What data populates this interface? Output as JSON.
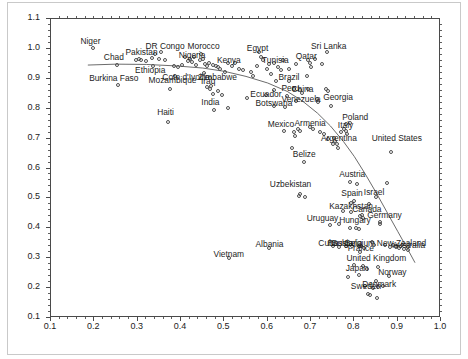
{
  "chart_data": {
    "type": "scatter",
    "title": "",
    "subtitle": "",
    "xlabel": "",
    "ylabel": "",
    "xlim": [
      0.1,
      1.0
    ],
    "ylim": [
      0.1,
      1.1
    ],
    "xticks": [
      "0.1",
      "0.2",
      "0.3",
      "0.4",
      "0.5",
      "0.6",
      "0.7",
      "0.8",
      "0.9",
      "1.0"
    ],
    "xtick_values": [
      0.1,
      0.2,
      0.3,
      0.4,
      0.5,
      0.6,
      0.7,
      0.8,
      0.9,
      1.0
    ],
    "yticks": [
      "0.1",
      "0.2",
      "0.3",
      "0.4",
      "0.5",
      "0.6",
      "0.7",
      "0.8",
      "0.9",
      "1.0",
      "1.1"
    ],
    "ytick_values": [
      0.1,
      0.2,
      0.3,
      0.4,
      0.5,
      0.6,
      0.7,
      0.8,
      0.9,
      1.0,
      1.1
    ],
    "grid": false,
    "legend": "none",
    "marker": "open-circle",
    "marker_color": "#4f4f4f",
    "trend_line": {
      "label": "fitted-trend-curve",
      "color": "#5a5a5a",
      "points": [
        [
          0.185,
          0.946
        ],
        [
          0.25,
          0.949
        ],
        [
          0.32,
          0.948
        ],
        [
          0.39,
          0.943
        ],
        [
          0.45,
          0.936
        ],
        [
          0.5,
          0.925
        ],
        [
          0.55,
          0.908
        ],
        [
          0.6,
          0.886
        ],
        [
          0.645,
          0.858
        ],
        [
          0.68,
          0.826
        ],
        [
          0.715,
          0.785
        ],
        [
          0.745,
          0.742
        ],
        [
          0.775,
          0.69
        ],
        [
          0.8,
          0.64
        ],
        [
          0.825,
          0.582
        ],
        [
          0.85,
          0.52
        ],
        [
          0.875,
          0.455
        ],
        [
          0.9,
          0.39
        ],
        [
          0.925,
          0.325
        ],
        [
          0.94,
          0.285
        ]
      ]
    },
    "labeled_points": [
      {
        "name": "Niger",
        "x": 0.2,
        "y": 0.999,
        "lx": 0.168,
        "ly": 1.022
      },
      {
        "name": "Chad",
        "x": 0.254,
        "y": 0.944,
        "lx": 0.222,
        "ly": 0.968
      },
      {
        "name": "Burkina Faso",
        "x": 0.256,
        "y": 0.876,
        "lx": 0.188,
        "ly": 0.9
      },
      {
        "name": "Pakistan",
        "x": 0.305,
        "y": 0.962,
        "lx": 0.272,
        "ly": 0.985
      },
      {
        "name": "Ethiopia",
        "x": 0.338,
        "y": 0.94,
        "lx": 0.294,
        "ly": 0.926
      },
      {
        "name": "DR Congo",
        "x": 0.355,
        "y": 0.985,
        "lx": 0.318,
        "ly": 1.005
      },
      {
        "name": "Mozambique",
        "x": 0.377,
        "y": 0.862,
        "lx": 0.325,
        "ly": 0.892
      },
      {
        "name": "Cote d'Ivoire",
        "x": 0.388,
        "y": 0.906,
        "lx": 0.357,
        "ly": 0.903
      },
      {
        "name": "Haiti",
        "x": 0.373,
        "y": 0.752,
        "lx": 0.345,
        "ly": 0.784
      },
      {
        "name": "Nigeria",
        "x": 0.424,
        "y": 0.963,
        "lx": 0.395,
        "ly": 0.975
      },
      {
        "name": "Morocco",
        "x": 0.448,
        "y": 0.98,
        "lx": 0.415,
        "ly": 1.005
      },
      {
        "name": "Zimbabwe",
        "x": 0.469,
        "y": 0.899,
        "lx": 0.44,
        "ly": 0.903
      },
      {
        "name": "Iraq",
        "x": 0.472,
        "y": 0.872,
        "lx": 0.446,
        "ly": 0.888
      },
      {
        "name": "India",
        "x": 0.478,
        "y": 0.793,
        "lx": 0.447,
        "ly": 0.818
      },
      {
        "name": "Kenya",
        "x": 0.51,
        "y": 0.951,
        "lx": 0.483,
        "ly": 0.96
      },
      {
        "name": "Vietnam",
        "x": 0.512,
        "y": 0.298,
        "lx": 0.475,
        "ly": 0.312
      },
      {
        "name": "Albania",
        "x": 0.605,
        "y": 0.33,
        "lx": 0.572,
        "ly": 0.345
      },
      {
        "name": "Egypt",
        "x": 0.583,
        "y": 0.987,
        "lx": 0.552,
        "ly": 1.0
      },
      {
        "name": "Ecuador",
        "x": 0.598,
        "y": 0.842,
        "lx": 0.56,
        "ly": 0.846
      },
      {
        "name": "Tunisia",
        "x": 0.617,
        "y": 0.948,
        "lx": 0.587,
        "ly": 0.958
      },
      {
        "name": "Botswana",
        "x": 0.618,
        "y": 0.806,
        "lx": 0.572,
        "ly": 0.815
      },
      {
        "name": "Mexico",
        "x": 0.64,
        "y": 0.723,
        "lx": 0.6,
        "ly": 0.747
      },
      {
        "name": "Brazil",
        "x": 0.652,
        "y": 0.89,
        "lx": 0.625,
        "ly": 0.903
      },
      {
        "name": "Peru",
        "x": 0.662,
        "y": 0.862,
        "lx": 0.632,
        "ly": 0.866
      },
      {
        "name": "China",
        "x": 0.678,
        "y": 0.858,
        "lx": 0.655,
        "ly": 0.862
      },
      {
        "name": "Venezuela",
        "x": 0.668,
        "y": 0.823,
        "lx": 0.632,
        "ly": 0.83
      },
      {
        "name": "Qatar",
        "x": 0.695,
        "y": 0.958,
        "lx": 0.665,
        "ly": 0.972
      },
      {
        "name": "Armenia",
        "x": 0.7,
        "y": 0.735,
        "lx": 0.662,
        "ly": 0.748
      },
      {
        "name": "Uzbekistan",
        "x": 0.678,
        "y": 0.512,
        "lx": 0.605,
        "ly": 0.545
      },
      {
        "name": "Belize",
        "x": 0.686,
        "y": 0.617,
        "lx": 0.658,
        "ly": 0.645
      },
      {
        "name": "Sri Lanka",
        "x": 0.74,
        "y": 0.985,
        "lx": 0.7,
        "ly": 1.005
      },
      {
        "name": "Georgia",
        "x": 0.742,
        "y": 0.855,
        "lx": 0.728,
        "ly": 0.835
      },
      {
        "name": "Argentina",
        "x": 0.756,
        "y": 0.7,
        "lx": 0.723,
        "ly": 0.7
      },
      {
        "name": "Uruguay",
        "x": 0.746,
        "y": 0.408,
        "lx": 0.69,
        "ly": 0.43
      },
      {
        "name": "Cuba",
        "x": 0.752,
        "y": 0.338,
        "lx": 0.717,
        "ly": 0.348
      },
      {
        "name": "Russia",
        "x": 0.768,
        "y": 0.335,
        "lx": 0.738,
        "ly": 0.348
      },
      {
        "name": "Bulgaria",
        "x": 0.782,
        "y": 0.338,
        "lx": 0.748,
        "ly": 0.348
      },
      {
        "name": "Italy",
        "x": 0.782,
        "y": 0.722,
        "lx": 0.762,
        "ly": 0.742
      },
      {
        "name": "Poland",
        "x": 0.792,
        "y": 0.748,
        "lx": 0.772,
        "ly": 0.77
      },
      {
        "name": "Austria",
        "x": 0.793,
        "y": 0.551,
        "lx": 0.765,
        "ly": 0.577
      },
      {
        "name": "Spain",
        "x": 0.802,
        "y": 0.488,
        "lx": 0.77,
        "ly": 0.515
      },
      {
        "name": "Kazakhstan",
        "x": 0.795,
        "y": 0.452,
        "lx": 0.742,
        "ly": 0.47
      },
      {
        "name": "Hungary",
        "x": 0.805,
        "y": 0.398,
        "lx": 0.765,
        "ly": 0.425
      },
      {
        "name": "Canada",
        "x": 0.82,
        "y": 0.44,
        "lx": 0.795,
        "ly": 0.462
      },
      {
        "name": "Belgium",
        "x": 0.812,
        "y": 0.337,
        "lx": 0.778,
        "ly": 0.348
      },
      {
        "name": "France",
        "x": 0.815,
        "y": 0.318,
        "lx": 0.785,
        "ly": 0.33
      },
      {
        "name": "United Kingdom",
        "x": 0.822,
        "y": 0.272,
        "lx": 0.782,
        "ly": 0.298
      },
      {
        "name": "Japan",
        "x": 0.812,
        "y": 0.24,
        "lx": 0.78,
        "ly": 0.265
      },
      {
        "name": "Sweden",
        "x": 0.833,
        "y": 0.178,
        "lx": 0.792,
        "ly": 0.203
      },
      {
        "name": "Denmark",
        "x": 0.858,
        "y": 0.2,
        "lx": 0.818,
        "ly": 0.212
      },
      {
        "name": "Israel",
        "x": 0.852,
        "y": 0.5,
        "lx": 0.822,
        "ly": 0.518
      },
      {
        "name": "Germany",
        "x": 0.862,
        "y": 0.418,
        "lx": 0.83,
        "ly": 0.44
      },
      {
        "name": "United States",
        "x": 0.888,
        "y": 0.653,
        "lx": 0.84,
        "ly": 0.7
      },
      {
        "name": "Norway",
        "x": 0.882,
        "y": 0.238,
        "lx": 0.855,
        "ly": 0.25
      },
      {
        "name": "New Zealand",
        "x": 0.898,
        "y": 0.333,
        "lx": 0.852,
        "ly": 0.348
      },
      {
        "name": "Australia",
        "x": 0.925,
        "y": 0.325,
        "lx": 0.888,
        "ly": 0.34
      }
    ],
    "unlabeled_points": [
      [
        0.298,
        0.958
      ],
      [
        0.311,
        0.96
      ],
      [
        0.322,
        0.955
      ],
      [
        0.336,
        0.966
      ],
      [
        0.342,
        0.978
      ],
      [
        0.352,
        0.962
      ],
      [
        0.365,
        0.958
      ],
      [
        0.385,
        0.94
      ],
      [
        0.395,
        0.935
      ],
      [
        0.404,
        0.944
      ],
      [
        0.412,
        0.968
      ],
      [
        0.418,
        0.955
      ],
      [
        0.428,
        0.952
      ],
      [
        0.433,
        0.968
      ],
      [
        0.438,
        0.944
      ],
      [
        0.445,
        0.958
      ],
      [
        0.452,
        0.962
      ],
      [
        0.458,
        0.945
      ],
      [
        0.462,
        0.938
      ],
      [
        0.468,
        0.95
      ],
      [
        0.475,
        0.942
      ],
      [
        0.482,
        0.94
      ],
      [
        0.488,
        0.935
      ],
      [
        0.493,
        0.93
      ],
      [
        0.455,
        0.915
      ],
      [
        0.462,
        0.87
      ],
      [
        0.47,
        0.862
      ],
      [
        0.475,
        0.845
      ],
      [
        0.488,
        0.855
      ],
      [
        0.498,
        0.842
      ],
      [
        0.503,
        0.92
      ],
      [
        0.51,
        0.8
      ],
      [
        0.52,
        0.938
      ],
      [
        0.528,
        0.948
      ],
      [
        0.535,
        0.93
      ],
      [
        0.545,
        0.925
      ],
      [
        0.555,
        0.832
      ],
      [
        0.563,
        0.918
      ],
      [
        0.568,
        0.905
      ],
      [
        0.578,
        0.94
      ],
      [
        0.586,
        0.968
      ],
      [
        0.592,
        0.958
      ],
      [
        0.6,
        0.93
      ],
      [
        0.605,
        0.945
      ],
      [
        0.61,
        0.912
      ],
      [
        0.618,
        0.86
      ],
      [
        0.622,
        0.89
      ],
      [
        0.625,
        0.935
      ],
      [
        0.632,
        0.925
      ],
      [
        0.637,
        0.958
      ],
      [
        0.642,
        0.802
      ],
      [
        0.648,
        0.838
      ],
      [
        0.652,
        0.93
      ],
      [
        0.658,
        0.665
      ],
      [
        0.662,
        0.72
      ],
      [
        0.665,
        0.705
      ],
      [
        0.668,
        0.945
      ],
      [
        0.672,
        0.73
      ],
      [
        0.675,
        0.505
      ],
      [
        0.678,
        0.722
      ],
      [
        0.682,
        0.85
      ],
      [
        0.688,
        0.5
      ],
      [
        0.692,
        0.905
      ],
      [
        0.695,
        0.862
      ],
      [
        0.7,
        0.95
      ],
      [
        0.703,
        0.935
      ],
      [
        0.708,
        0.728
      ],
      [
        0.712,
        0.962
      ],
      [
        0.715,
        0.828
      ],
      [
        0.718,
        0.818
      ],
      [
        0.722,
        0.718
      ],
      [
        0.728,
        0.945
      ],
      [
        0.733,
        0.712
      ],
      [
        0.738,
        0.862
      ],
      [
        0.742,
        0.695
      ],
      [
        0.748,
        0.805
      ],
      [
        0.752,
        0.68
      ],
      [
        0.758,
        0.69
      ],
      [
        0.762,
        0.68
      ],
      [
        0.765,
        0.665
      ],
      [
        0.768,
        0.41
      ],
      [
        0.772,
        0.718
      ],
      [
        0.775,
        0.455
      ],
      [
        0.778,
        0.728
      ],
      [
        0.782,
        0.745
      ],
      [
        0.785,
        0.712
      ],
      [
        0.788,
        0.235
      ],
      [
        0.792,
        0.398
      ],
      [
        0.795,
        0.48
      ],
      [
        0.798,
        0.338
      ],
      [
        0.802,
        0.275
      ],
      [
        0.808,
        0.545
      ],
      [
        0.812,
        0.395
      ],
      [
        0.815,
        0.438
      ],
      [
        0.818,
        0.338
      ],
      [
        0.822,
        0.432
      ],
      [
        0.825,
        0.33
      ],
      [
        0.828,
        0.205
      ],
      [
        0.832,
        0.262
      ],
      [
        0.835,
        0.478
      ],
      [
        0.838,
        0.172
      ],
      [
        0.842,
        0.35
      ],
      [
        0.845,
        0.198
      ],
      [
        0.848,
        0.342
      ],
      [
        0.852,
        0.222
      ],
      [
        0.855,
        0.162
      ],
      [
        0.858,
        0.268
      ],
      [
        0.862,
        0.412
      ],
      [
        0.868,
        0.205
      ],
      [
        0.872,
        0.34
      ],
      [
        0.878,
        0.548
      ],
      [
        0.885,
        0.335
      ],
      [
        0.892,
        0.342
      ],
      [
        0.898,
        0.338
      ],
      [
        0.905,
        0.332
      ],
      [
        0.912,
        0.34
      ],
      [
        0.918,
        0.328
      ],
      [
        0.925,
        0.335
      ]
    ]
  }
}
